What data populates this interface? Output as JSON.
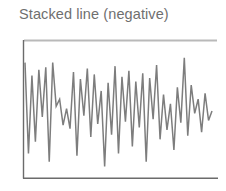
{
  "figure": {
    "title": "Stacked line (negative)",
    "background_color": "#ffffff",
    "title_color": "#6f6f6f"
  },
  "colors": {
    "series_line": "#7d7d7d",
    "axis": "#6b6b6b",
    "top_rule": "#b9b9b9"
  },
  "chart_data": {
    "type": "line",
    "title": "Stacked line (negative)",
    "subtitle": "",
    "xlabel": "",
    "ylabel": "",
    "grid": false,
    "legend": "none",
    "axes": {
      "left_spine": true,
      "bottom_spine": true,
      "top_rule": true,
      "right_spine": false,
      "tick_labels_x": [],
      "tick_labels_y": []
    },
    "xlim": [
      0,
      54
    ],
    "ylim": [
      -1.0,
      0.0
    ],
    "annotations": [],
    "series": [
      {
        "name": "series-1",
        "color": "#7d7d7d",
        "x": [
          0,
          1,
          2,
          3,
          4,
          5,
          6,
          7,
          8,
          9,
          10,
          11,
          12,
          13,
          14,
          15,
          16,
          17,
          18,
          19,
          20,
          21,
          22,
          23,
          24,
          25,
          26,
          27,
          28,
          29,
          30,
          31,
          32,
          33,
          34,
          35,
          36,
          37,
          38,
          39,
          40,
          41,
          42,
          43,
          44,
          45,
          46,
          47,
          48,
          49,
          50,
          51,
          52,
          53,
          54
        ],
        "values": [
          -0.09,
          -0.86,
          -0.2,
          -0.76,
          -0.15,
          -0.55,
          -0.13,
          -0.93,
          -0.09,
          -0.46,
          -0.4,
          -0.62,
          -0.48,
          -0.65,
          -0.17,
          -0.88,
          -0.23,
          -0.54,
          -0.14,
          -0.72,
          -0.19,
          -0.61,
          -0.33,
          -0.97,
          -0.26,
          -0.7,
          -0.12,
          -0.86,
          -0.21,
          -0.59,
          -0.16,
          -0.8,
          -0.25,
          -0.64,
          -0.18,
          -0.93,
          -0.22,
          -0.57,
          -0.11,
          -0.74,
          -0.36,
          -0.66,
          -0.44,
          -0.83,
          -0.3,
          -0.6,
          -0.05,
          -0.71,
          -0.28,
          -0.52,
          -0.4,
          -0.68,
          -0.35,
          -0.58,
          -0.5
        ]
      }
    ]
  }
}
